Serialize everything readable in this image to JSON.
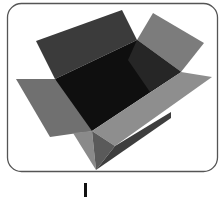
{
  "image": {
    "subject": "open cardboard box",
    "alt": "Grayscale illustration of an open empty cardboard box inside a rounded-rectangle frame",
    "style": "grayscale"
  },
  "frame": {
    "border_color": "#555555",
    "background": "#ffffff",
    "corner_radius": 14
  },
  "colors": {
    "interior": "#0e0e0e",
    "back_flap": "#3a3a3a",
    "right_back_flap": "#7a7a7a",
    "left_flap": "#6e6e6e",
    "front_flap": "#8c8c8c",
    "left_side": "#8a8a8a",
    "right_side": "#3e3e3e",
    "mark": "#111111"
  }
}
